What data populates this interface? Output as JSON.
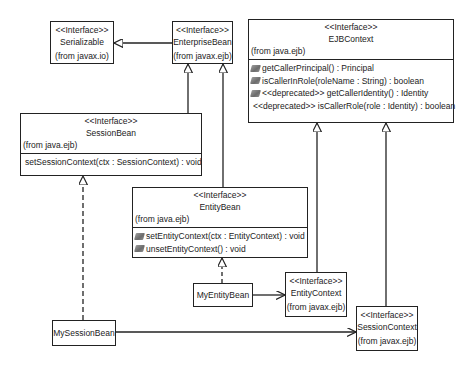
{
  "diagram": {
    "type": "UML class diagram",
    "interfaces": {
      "serializable": {
        "stereotype": "<<Interface>>",
        "name": "Serializable",
        "package": "(from javax.io)"
      },
      "enterprise_bean": {
        "stereotype": "<<Interface>>",
        "name": "EnterpriseBean",
        "package": "(from javax.ejb)"
      },
      "ejb_context": {
        "stereotype": "<<Interface>>",
        "name": "EJBContext",
        "package": "(from java.ejb)",
        "operations": [
          "getCallerPrincipal() : Principal",
          "isCallerInRole(roleName : String) : boolean",
          "<<deprecated>> getCallerIdentity() : Identity",
          "<<deprecated>> isCallerRole(role : Identity) : boolean"
        ]
      },
      "session_bean": {
        "stereotype": "<<Interface>>",
        "name": "SessionBean",
        "package": "(from java.ejb)",
        "operations": [
          "setSessionContext(ctx : SessionContext) : void"
        ]
      },
      "entity_bean": {
        "stereotype": "<<Interface>>",
        "name": "EntityBean",
        "package": "(from java.ejb)",
        "operations": [
          "setEntityContext(ctx : EntityContext) : void",
          "unsetEntityContext() : void"
        ]
      },
      "entity_context": {
        "stereotype": "<<Interface>>",
        "name": "EntityContext",
        "package": "(from javax.ejb)"
      },
      "session_context": {
        "stereotype": "<<Interface>>",
        "name": "SessionContext",
        "package": "(from javax.ejb)"
      }
    },
    "classes": {
      "my_entity_bean": {
        "name": "MyEntityBean"
      },
      "my_session_bean": {
        "name": "MySessionBean"
      }
    },
    "relationships": [
      {
        "from": "EnterpriseBean",
        "to": "Serializable",
        "kind": "generalization"
      },
      {
        "from": "SessionBean",
        "to": "EnterpriseBean",
        "kind": "generalization"
      },
      {
        "from": "EntityBean",
        "to": "EnterpriseBean",
        "kind": "generalization"
      },
      {
        "from": "EntityContext",
        "to": "EJBContext",
        "kind": "generalization"
      },
      {
        "from": "SessionContext",
        "to": "EJBContext",
        "kind": "generalization"
      },
      {
        "from": "MySessionBean",
        "to": "SessionBean",
        "kind": "realization"
      },
      {
        "from": "MyEntityBean",
        "to": "EntityBean",
        "kind": "realization"
      },
      {
        "from": "MyEntityBean",
        "to": "EntityContext",
        "kind": "association"
      },
      {
        "from": "MySessionBean",
        "to": "SessionContext",
        "kind": "association"
      }
    ],
    "colors": {
      "line": "#222222",
      "background": "#ffffff",
      "icon": "#7a7a7a"
    }
  }
}
